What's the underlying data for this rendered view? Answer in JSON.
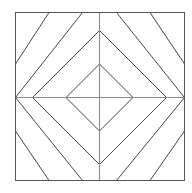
{
  "figure": {
    "background_color": "#ffffff",
    "canvas": {
      "width": 192,
      "height": 193
    },
    "center": {
      "x": 99,
      "y": 97
    },
    "colors": {
      "frame_stroke": "#55555a",
      "diamond_stroke": "#46464b",
      "diagonal_stroke": "#46464b",
      "axis_stroke": "#8a8a8e",
      "fill": "#ffffff"
    },
    "stroke_widths": {
      "frame": 1,
      "diamond": 1,
      "diagonal": 1,
      "axis": 1.1
    },
    "band_spacing": 33.5
  },
  "frame": {
    "name": "outer-square",
    "left": 15,
    "top": 12,
    "right": 184,
    "bottom": 180,
    "width": 169,
    "height": 168
  },
  "axes": {
    "horizontal": {
      "y": 97,
      "x1": 15,
      "x2": 184
    },
    "vertical": {
      "x": 99,
      "y1": 12,
      "y2": 180
    }
  },
  "diamonds": [
    {
      "name": "inner-diamond",
      "radius": 33.5,
      "vertices": {
        "top": {
          "x": 99,
          "y": 63.5
        },
        "right": {
          "x": 132.5,
          "y": 97
        },
        "bottom": {
          "x": 99,
          "y": 130.5
        },
        "left": {
          "x": 65.5,
          "y": 97
        }
      }
    },
    {
      "name": "outer-diamond",
      "radius": 67,
      "vertices": {
        "top": {
          "x": 99,
          "y": 30
        },
        "right": {
          "x": 166,
          "y": 97
        },
        "bottom": {
          "x": 99,
          "y": 164
        },
        "left": {
          "x": 32,
          "y": 97
        }
      }
    }
  ],
  "quadrant_diagonals": {
    "note": "Each quadrant carries two parallel 45-degree lines continuing the concentric band pattern beyond the outer diamond, clipped to the square frame.",
    "top_left": {
      "name": "top-left-quadrant",
      "direction": "lower-left-to-upper-right",
      "lines": [
        {
          "x1": 15,
          "y1": 63.5,
          "x2": 48.5,
          "y2": 12
        },
        {
          "x1": 15,
          "y1": 97,
          "x2": 82,
          "y2": 12
        }
      ]
    },
    "top_right": {
      "name": "top-right-quadrant",
      "direction": "upper-left-to-lower-right",
      "lines": [
        {
          "x1": 149.5,
          "y1": 12,
          "x2": 184,
          "y2": 63.5
        },
        {
          "x1": 116,
          "y1": 12,
          "x2": 184,
          "y2": 97
        }
      ]
    },
    "bottom_left": {
      "name": "bottom-left-quadrant",
      "direction": "upper-left-to-lower-right",
      "lines": [
        {
          "x1": 15,
          "y1": 130.5,
          "x2": 48.5,
          "y2": 180
        },
        {
          "x1": 15,
          "y1": 97,
          "x2": 82,
          "y2": 180
        }
      ]
    },
    "bottom_right": {
      "name": "bottom-right-quadrant",
      "direction": "lower-left-to-upper-right",
      "lines": [
        {
          "x1": 149.5,
          "y1": 180,
          "x2": 184,
          "y2": 130.5
        },
        {
          "x1": 116,
          "y1": 180,
          "x2": 184,
          "y2": 97
        }
      ]
    }
  }
}
